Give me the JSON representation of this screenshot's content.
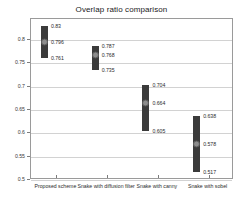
{
  "chart_data": {
    "type": "bar",
    "title": "Overlap ratio comparison",
    "xlabel": "",
    "ylabel": "",
    "ylim": [
      0.5,
      0.845
    ],
    "grid": true,
    "legend": "none",
    "yticks": [
      0.8,
      0.75,
      0.7,
      0.65,
      0.6,
      0.55,
      0.5
    ],
    "ytick_labels": [
      "0.8",
      "0.75",
      "0.7",
      "0.65",
      "0.6",
      "0.55",
      "0.5"
    ],
    "categories": [
      "Proposed scheme",
      "Snake with diffusion filter",
      "Snake with canny",
      "Snake with sobel"
    ],
    "series": [
      {
        "name": "max",
        "values": [
          0.83,
          0.787,
          0.704,
          0.638
        ]
      },
      {
        "name": "mean",
        "values": [
          0.796,
          0.768,
          0.664,
          0.578
        ]
      },
      {
        "name": "min",
        "values": [
          0.761,
          0.735,
          0.605,
          0.517
        ]
      }
    ],
    "bars": [
      {
        "category": "Proposed scheme",
        "max": 0.83,
        "mean": 0.796,
        "min": 0.761,
        "max_label": "0.83",
        "mean_label": "0.796",
        "min_label": "0.761"
      },
      {
        "category": "Snake with diffusion filter",
        "max": 0.787,
        "mean": 0.768,
        "min": 0.735,
        "max_label": "0.787",
        "mean_label": "0.768",
        "min_label": "0.735"
      },
      {
        "category": "Snake with canny",
        "max": 0.704,
        "mean": 0.664,
        "min": 0.605,
        "max_label": "0.704",
        "mean_label": "0.664",
        "min_label": "0.605"
      },
      {
        "category": "Snake with sobel",
        "max": 0.638,
        "mean": 0.578,
        "min": 0.517,
        "max_label": "0.638",
        "mean_label": "0.578",
        "min_label": "0.517"
      }
    ],
    "colors": {
      "bar": "#3b3b3b",
      "marker": "#8d8d8d",
      "grid": "#d2d2d2",
      "axis": "#9a9a9a",
      "text": "#2b2b2b",
      "background": "#ffffff"
    }
  }
}
